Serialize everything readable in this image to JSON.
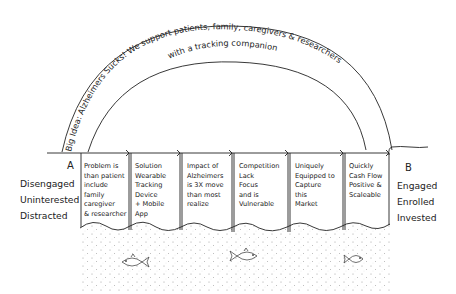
{
  "arch": {
    "line1": "Big Idea: Alzheimers Sucks! We support patients, family, caregivers & researchers",
    "line2": "with a tracking companion"
  },
  "start": {
    "letter": "A",
    "states": [
      "Disengaged",
      "Uninterested",
      "Distracted"
    ]
  },
  "end": {
    "letter": "B",
    "states": [
      "Engaged",
      "Enrolled",
      "Invested"
    ]
  },
  "panels": [
    {
      "text": "Problem is\nthan patient\ninclude\nfamily\ncaregiver\n& researcher"
    },
    {
      "text": "Solution\nWearable\nTracking\nDevice\n+ Mobile\nApp"
    },
    {
      "text": "Impact of\nAlzheimers\nis 3X move\nthan most\nrealize"
    },
    {
      "text": "Competition\nLack\nFocus\nand is\nVulnerable"
    },
    {
      "text": "Uniquely\nEquipped to\nCapture\nthis\nMarket"
    },
    {
      "text": "Quickly\nCash Flow\nPositive &\nScaleable"
    }
  ],
  "decorations": {
    "fish": [
      "fish-left",
      "fish-middle",
      "fish-right"
    ]
  },
  "colors": {
    "ink": "#222222",
    "background": "#ffffff",
    "dots": "#9a9a9a"
  }
}
